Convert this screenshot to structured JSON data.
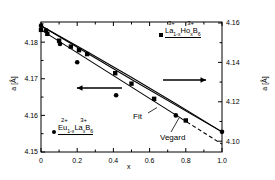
{
  "chart_data": {
    "type": "scatter",
    "title": "",
    "xlabel": "x",
    "ylabel": "a [Å]",
    "ylabel_right": "a [Å]",
    "xlim": [
      0,
      1.0
    ],
    "ylim_left": [
      4.15,
      4.1855
    ],
    "ylim_right": [
      4.0945,
      4.1605
    ],
    "grid": false,
    "legend_position": "inside",
    "xticks": [
      "0",
      "0.2",
      "0.4",
      "0.6",
      "0.8",
      "1.0"
    ],
    "xtick_values": [
      0,
      0.2,
      0.4,
      0.6,
      0.8,
      1.0
    ],
    "yticks_left": [
      "4.18",
      "4.17",
      "4.16",
      "4.15"
    ],
    "ytick_values_left": [
      4.18,
      4.17,
      4.16,
      4.15
    ],
    "yticks_right": [
      "4.16",
      "4.14",
      "4.12",
      "4.10"
    ],
    "ytick_values_right": [
      4.16,
      4.14,
      4.12,
      4.1
    ],
    "series": [
      {
        "name": "La1-xHoxB6",
        "label_text": "La",
        "label_sub1": "1-x",
        "label_mid": "Ho",
        "label_sub2": "x",
        "label_end": "B",
        "label_sub3": "6",
        "charge_left": "3+",
        "charge_right": "3+",
        "marker": "square",
        "axis": "right",
        "x": [
          0.0,
          0.035,
          0.1,
          0.165,
          0.21,
          0.255,
          0.41,
          0.5,
          0.625,
          0.8
        ],
        "values": [
          4.1565,
          4.1545,
          4.151,
          4.148,
          4.1462,
          4.1442,
          4.1345,
          4.1292,
          4.1215,
          4.1105
        ]
      },
      {
        "name": "Eu1-xLaxB6",
        "label_text": "Eu",
        "label_sub1": "1-x",
        "label_mid": "La",
        "label_sub2": "x",
        "label_end": "B",
        "label_sub3": "6",
        "charge_left": "2+",
        "charge_right": "3+",
        "marker": "circle",
        "axis": "left",
        "x": [
          0.0,
          0.028,
          0.105,
          0.2,
          0.415,
          0.745,
          1.0
        ],
        "values": [
          4.1845,
          4.1832,
          4.1795,
          4.1745,
          4.1655,
          4.16,
          4.1555
        ]
      }
    ],
    "lines": [
      {
        "name": "Fit",
        "label": "Fit",
        "style": "solid",
        "x0": 0.0,
        "y0": 4.1845,
        "x1": 1.0,
        "y1": 4.1555,
        "axis": "left"
      },
      {
        "name": "Vegard",
        "label": "Vegard",
        "style": "solid",
        "x0": 0.0,
        "y0": 4.1845,
        "x1": 1.0,
        "y1": 4.1555,
        "axis": "left"
      },
      {
        "name": "ho-series-fit",
        "label": "",
        "style": "solid-then-dashed",
        "x0": 0.0,
        "y0": 4.1565,
        "x1": 1.0,
        "y1": 4.0985,
        "axis": "right"
      }
    ],
    "annotations": [
      {
        "name": "left-arrow",
        "text": "",
        "direction": "left"
      },
      {
        "name": "right-arrow",
        "text": "",
        "direction": "right"
      }
    ]
  },
  "axes": {
    "x_label": "x",
    "y_left_label": "a [Å]",
    "y_right_label": "a [Å]"
  },
  "legend": {
    "top": {
      "charge1": "3+",
      "charge2": "3+",
      "formula": "La1-xHoxB6"
    },
    "bottom": {
      "charge1": "2+",
      "charge2": "3+",
      "formula": "Eu1-xLaxB6"
    }
  },
  "line_labels": {
    "fit": "Fit",
    "vegard": "Vegard"
  },
  "tick_labels": {
    "x": [
      "0",
      "0.2",
      "0.4",
      "0.6",
      "0.8",
      "1.0"
    ],
    "y_left": [
      "4.18",
      "4.17",
      "4.16",
      "4.15"
    ],
    "y_right": [
      "4.16",
      "4.14",
      "4.12",
      "4.10"
    ]
  }
}
